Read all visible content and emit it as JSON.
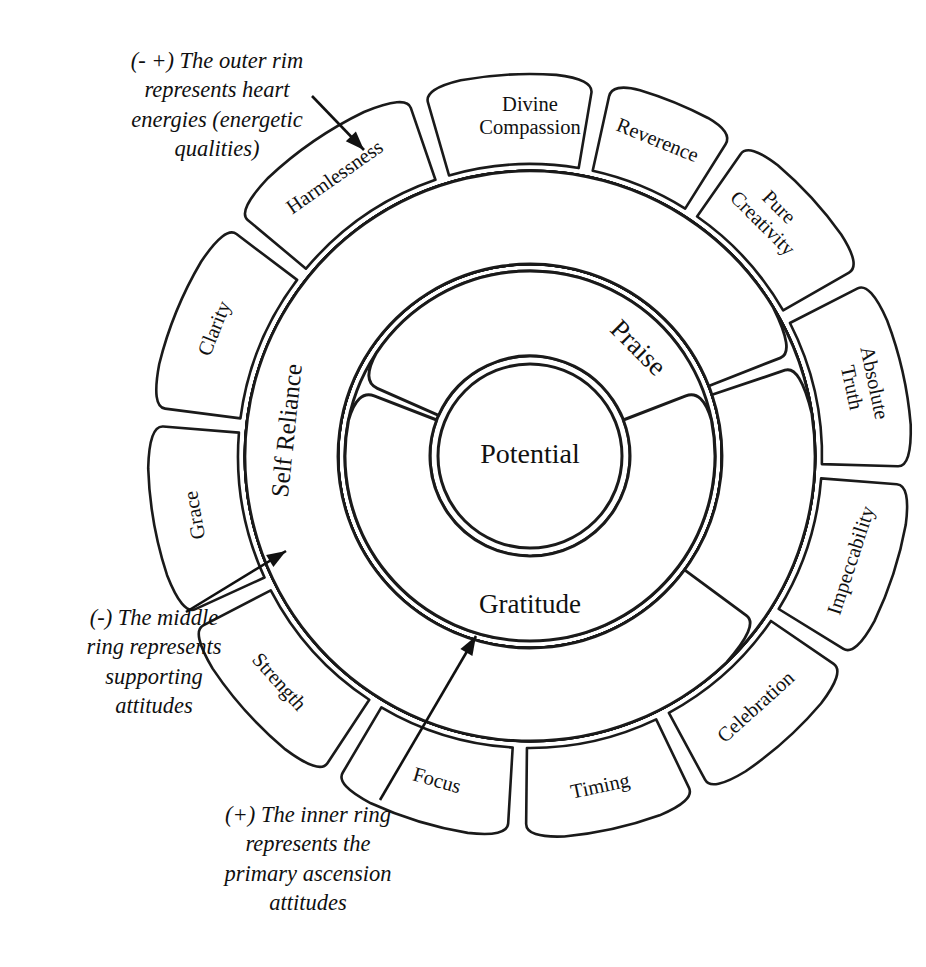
{
  "diagram": {
    "core": {
      "label": "Potential"
    },
    "rings": {
      "inner": {
        "name": "inner-ring",
        "description": "primary ascension attitudes",
        "petals": [
          {
            "label": "Love",
            "angle": 135,
            "flip": false
          },
          {
            "label": "Praise",
            "angle": 45,
            "flip": false
          },
          {
            "label": "Gratitude",
            "angle": 270,
            "flip": true
          }
        ]
      },
      "middle": {
        "name": "middle-ring",
        "description": "supporting attitudes",
        "petals": [
          {
            "label": "Calmness/Poise",
            "angle": 116,
            "flip": false
          },
          {
            "label": "Failure",
            "angle": 64,
            "flip": false
          },
          {
            "label": "Time",
            "angle": 6,
            "flip": false
          },
          {
            "label": "Generosity",
            "angle": 308,
            "flip": true
          },
          {
            "label": "Grace",
            "angle": 262,
            "flip": true
          },
          {
            "label": "Reverence",
            "angle": 226,
            "flip": true
          },
          {
            "label": "Self Reliance",
            "angle": 174,
            "flip": false
          }
        ]
      },
      "outer": {
        "name": "outer-ring",
        "description": "heart energies (energetic qualities)",
        "petals": [
          {
            "label": "Divine Compassion",
            "angle": 90,
            "flip": false,
            "lines": [
              "Divine",
              "Compassion"
            ]
          },
          {
            "label": "Harmlessness",
            "angle": 125,
            "flip": false,
            "lines": [
              "Harmlessness"
            ]
          },
          {
            "label": "Clarity",
            "angle": 158,
            "flip": false,
            "lines": [
              "Clarity"
            ]
          },
          {
            "label": "Grace",
            "angle": 190,
            "flip": false,
            "lines": [
              "Grace"
            ]
          },
          {
            "label": "Strength",
            "angle": 222,
            "flip": true,
            "lines": [
              "Strength"
            ]
          },
          {
            "label": "Focus",
            "angle": 254,
            "flip": true,
            "lines": [
              "Focus"
            ]
          },
          {
            "label": "Timing",
            "angle": 282,
            "flip": true,
            "lines": [
              "Timing"
            ]
          },
          {
            "label": "Celebration",
            "angle": 312,
            "flip": true,
            "lines": [
              "Celebration"
            ]
          },
          {
            "label": "Impeccability",
            "angle": 342,
            "flip": true,
            "lines": [
              "Impeccability"
            ]
          },
          {
            "label": "Absolute Truth",
            "angle": 12,
            "flip": false,
            "lines": [
              "Absolute",
              "Truth"
            ]
          },
          {
            "label": "Pure Creativity",
            "angle": 45,
            "flip": false,
            "lines": [
              "Pure",
              "Creativity"
            ]
          },
          {
            "label": "Reverence",
            "angle": 68,
            "flip": false,
            "lines": [
              "Reverence"
            ]
          }
        ]
      }
    }
  },
  "annotations": {
    "outer": {
      "name": "annotation-outer-rim",
      "text": "(- +) The outer rim\nrepresents heart\nenergies (energetic\nqualities)"
    },
    "middle": {
      "name": "annotation-middle-ring",
      "text": "(-) The middle\nring represents\nsupporting\nattitudes"
    },
    "inner": {
      "name": "annotation-inner-ring",
      "text": "(+)  The inner ring\nrepresents the\nprimary ascension\nattitudes"
    }
  },
  "colors": {
    "stroke": "#1a1a1a",
    "fill": "#ffffff",
    "text": "#111111",
    "background": "#ffffff"
  },
  "geometry": {
    "center_x": 530,
    "center_y": 456,
    "core_radius": 92,
    "inner_r0": 100,
    "inner_r1": 185,
    "middle_r0": 192,
    "middle_r1": 285,
    "outer_r0": 292,
    "outer_r1": 382
  }
}
